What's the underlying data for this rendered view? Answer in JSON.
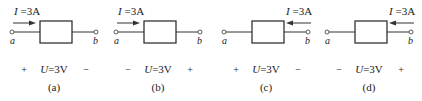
{
  "panels": [
    {
      "id": "a",
      "caption": "(a)",
      "current_label": "I =3A",
      "current_direction": "right",
      "voltage_label": "U=3V",
      "left_sign": "+",
      "right_sign": "−",
      "left_terminal": "a",
      "right_terminal": "b"
    },
    {
      "id": "b",
      "caption": "(b)",
      "current_label": "I =3A",
      "current_direction": "right",
      "voltage_label": "U=3V",
      "left_sign": "−",
      "right_sign": "+",
      "left_terminal": "a",
      "right_terminal": "b"
    },
    {
      "id": "c",
      "caption": "(c)",
      "current_label": "I =3A",
      "current_direction": "left",
      "voltage_label": "U=3V",
      "left_sign": "+",
      "right_sign": "−",
      "left_terminal": "a",
      "right_terminal": "b"
    },
    {
      "id": "d",
      "caption": "(d)",
      "current_label": "I =3A",
      "current_direction": "left",
      "voltage_label": "U=3V",
      "left_sign": "−",
      "right_sign": "+",
      "left_terminal": "a",
      "right_terminal": "b"
    }
  ]
}
